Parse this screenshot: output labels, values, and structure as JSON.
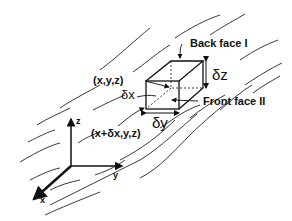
{
  "diagram": {
    "labels": {
      "back_face": "Back face I",
      "front_face": "Front face II",
      "point_xyz": "(x,y,z)",
      "point_x_dx": "(x+δx,y,z)",
      "delta_x": "δx",
      "delta_y": "δy",
      "delta_z": "δz"
    },
    "axes": {
      "x": "x",
      "y": "y",
      "z": "z"
    },
    "colors": {
      "ink": "#111111",
      "background": "#ffffff"
    }
  }
}
